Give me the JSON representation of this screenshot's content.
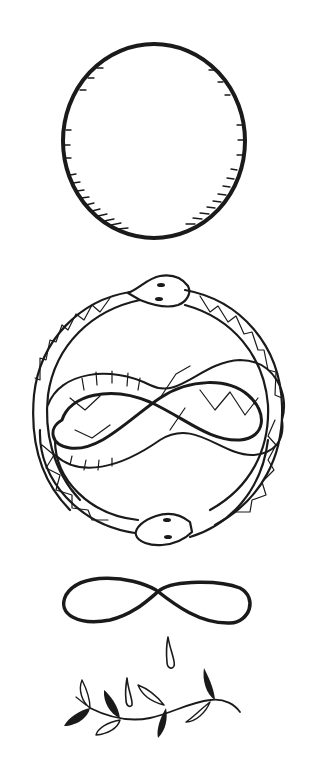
{
  "illustration": {
    "description": "Hand-drawn black ink line art of symbols stacked vertically on white background",
    "background_color": "#ffffff",
    "ink_color": "#1a1a1a",
    "elements": [
      {
        "id": "circle",
        "label": "Hand-drawn circle with hatched shading"
      },
      {
        "id": "ouroboros",
        "label": "Two snakes forming a circle around an infinity loop, heads at top and bottom"
      },
      {
        "id": "infinity",
        "label": "Bold infinity symbol"
      },
      {
        "id": "drops",
        "label": "Two falling teardrops"
      },
      {
        "id": "branch",
        "label": "Olive/laurel branch with black and outlined leaves"
      }
    ]
  }
}
